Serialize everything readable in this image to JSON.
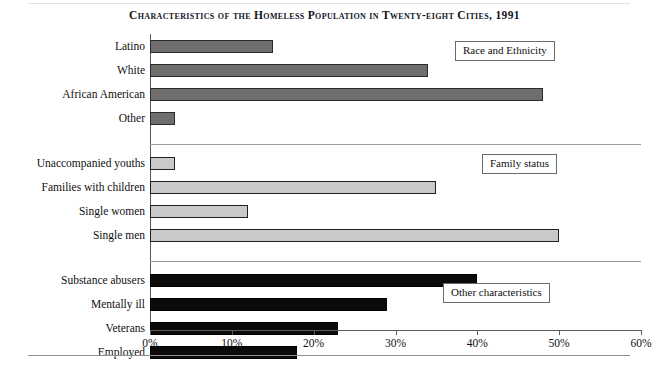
{
  "figure": {
    "title": "Characteristics of the Homeless Population in Twenty-eight Cities, 1991"
  },
  "axis": {
    "tick_labels": [
      "0%",
      "10%",
      "20%",
      "30%",
      "40%",
      "50%",
      "60%"
    ]
  },
  "legend": {
    "group1": "Race and Ethnicity",
    "group2": "Family status",
    "group3": "Other characteristics"
  },
  "categories": [
    "Latino",
    "White",
    "African American",
    "Other",
    "Unaccompanied youths",
    "Families with children",
    "Single women",
    "Single men",
    "Substance abusers",
    "Mentally ill",
    "Veterans",
    "Employed"
  ],
  "chart_data": {
    "type": "bar",
    "orientation": "horizontal",
    "title": "Characteristics of the Homeless Population in Twenty-eight Cities, 1991",
    "xlabel": "",
    "ylabel": "",
    "xlim": [
      0,
      60
    ],
    "xticks": [
      0,
      10,
      20,
      30,
      40,
      50,
      60
    ],
    "xtick_labels": [
      "0%",
      "10%",
      "20%",
      "30%",
      "40%",
      "50%",
      "60%"
    ],
    "grid": false,
    "legend_position": "inside-right",
    "value_unit": "percent",
    "groups": [
      {
        "name": "Race and Ethnicity",
        "color": "#6e6e6e",
        "categories": [
          "Latino",
          "White",
          "African American",
          "Other"
        ],
        "values": [
          15,
          34,
          48,
          3
        ]
      },
      {
        "name": "Family status",
        "color": "#c9c9c9",
        "categories": [
          "Unaccompanied youths",
          "Families with children",
          "Single women",
          "Single men"
        ],
        "values": [
          3,
          35,
          12,
          50
        ]
      },
      {
        "name": "Other characteristics",
        "color": "#0a0a0a",
        "categories": [
          "Substance abusers",
          "Mentally ill",
          "Veterans",
          "Employed"
        ],
        "values": [
          40,
          29,
          23,
          18
        ]
      }
    ],
    "categories_all": [
      "Latino",
      "White",
      "African American",
      "Other",
      "Unaccompanied youths",
      "Families with children",
      "Single women",
      "Single men",
      "Substance abusers",
      "Mentally ill",
      "Veterans",
      "Employed"
    ],
    "values_all": [
      15,
      34,
      48,
      3,
      3,
      35,
      12,
      50,
      40,
      29,
      23,
      18
    ]
  }
}
